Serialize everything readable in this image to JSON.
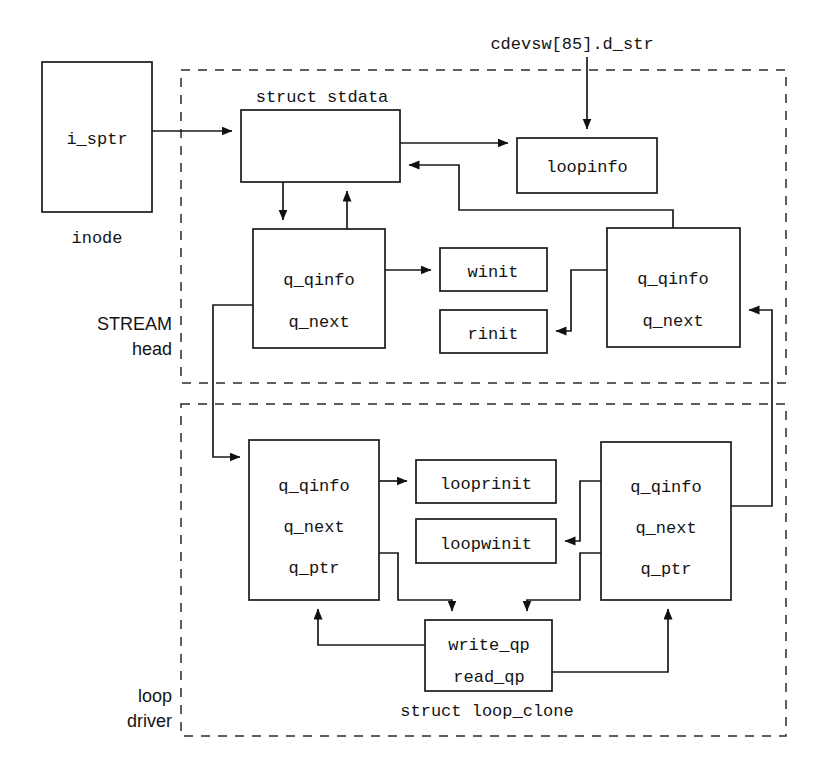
{
  "diagram": {
    "type": "block-diagram",
    "colors": {
      "stroke": "#1a1a1a",
      "text": "#141414",
      "dashed_region": "#2a2a2a",
      "background": "#ffffff"
    }
  },
  "regions": [
    {
      "id": "stream-head",
      "label_line1": "STREAM",
      "label_line2": "head",
      "style": "dashed"
    },
    {
      "id": "loop-driver",
      "label_line1": "loop",
      "label_line2": "driver",
      "style": "dashed"
    }
  ],
  "labels": {
    "cdevsw": "cdevsw[85].d_str",
    "struct_stdata": "struct stdata",
    "inode": "inode",
    "struct_loop_clone": "struct loop_clone"
  },
  "boxes": {
    "inode": {
      "fields": [
        "i_sptr"
      ]
    },
    "stdata": {
      "fields": []
    },
    "loopinfo": {
      "fields": [
        "loopinfo"
      ]
    },
    "sh_write_q": {
      "fields": [
        "q_qinfo",
        "q_next"
      ]
    },
    "sh_read_q": {
      "fields": [
        "q_qinfo",
        "q_next"
      ]
    },
    "winit": {
      "fields": [
        "winit"
      ]
    },
    "rinit": {
      "fields": [
        "rinit"
      ]
    },
    "ld_write_q": {
      "fields": [
        "q_qinfo",
        "q_next",
        "q_ptr"
      ]
    },
    "ld_read_q": {
      "fields": [
        "q_qinfo",
        "q_next",
        "q_ptr"
      ]
    },
    "looprinit": {
      "fields": [
        "looprinit"
      ]
    },
    "loopwinit": {
      "fields": [
        "loopwinit"
      ]
    },
    "loop_clone": {
      "fields": [
        "write_qp",
        "read_qp"
      ]
    }
  }
}
